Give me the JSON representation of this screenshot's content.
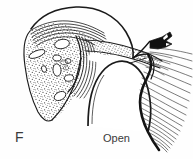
{
  "figure": {
    "type": "anatomical-line-drawing",
    "panel_letter": "F",
    "state_label": "Open",
    "background_color": "#fefefe",
    "ink_color": "#1a1a1a",
    "stipple_color": "#4a4a4a",
    "text_color": "#3a3a3a",
    "regions": [
      {
        "name": "stippled-soft-tissue",
        "description": "large wedge of stippled submucosal tissue occupying upper-left, tapering to a point at lower-left",
        "fill": "stipple"
      },
      {
        "name": "stippled-shelf",
        "description": "narrow stippled band extending to the right across the mid-field",
        "fill": "stipple"
      },
      {
        "name": "mucosal-layer-lines",
        "description": "several thin wavy parallel lines along the top of the stippled wedge",
        "count": 5
      },
      {
        "name": "vascular-lacunae",
        "description": "white elongated oval voids inside the stippled tissue",
        "count": 8
      },
      {
        "name": "airway-lumen",
        "description": "white open passage between the upper stippled shelf and the lower rounded body",
        "state": "open"
      },
      {
        "name": "concentric-fold-lines",
        "description": "nested curved lines forming a hook at the centre-left of the lumen",
        "count": 6
      },
      {
        "name": "rounded-body",
        "description": "large white dome-shaped structure in the lower centre bounded by a thick dark edge"
      },
      {
        "name": "muscle-fiber-fan",
        "description": "fan of fine radiating striations spreading to the right from the thick dark posterior edge",
        "count": 22
      },
      {
        "name": "cartilage-hook",
        "description": "small solid black angular hook at the upper right"
      }
    ]
  }
}
